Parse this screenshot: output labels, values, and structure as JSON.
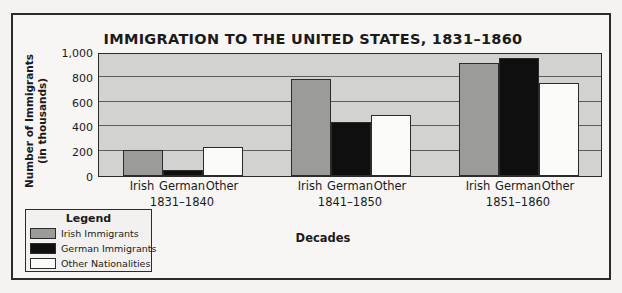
{
  "chart_data": {
    "type": "bar",
    "title": "IMMIGRATION TO THE UNITED STATES, 1831–1860",
    "xlabel": "Decades",
    "ylabel": "Number of Immigrants\n(in thousands)",
    "ylabel_line1": "Number of Immigrants",
    "ylabel_line2": "(in thousands)",
    "ylim": [
      0,
      1000
    ],
    "yticks": [
      0,
      200,
      400,
      600,
      800,
      1000
    ],
    "ytick_labels": [
      "0",
      "200",
      "400",
      "600",
      "800",
      "1,000"
    ],
    "grid": true,
    "legend_position": "below-left-outside",
    "categories": [
      "1831–1840",
      "1841–1850",
      "1851–1860"
    ],
    "subcategories": [
      "Irish",
      "German",
      "Other"
    ],
    "series": [
      {
        "name": "Irish Immigrants",
        "color": "#9b9b99",
        "values": [
          207,
          780,
          914
        ]
      },
      {
        "name": "German Immigrants",
        "color": "#100f0f",
        "values": [
          50,
          434,
          951
        ]
      },
      {
        "name": "Other Nationalities",
        "color": "#fbfbf9",
        "values": [
          234,
          495,
          750
        ]
      }
    ]
  },
  "legend": {
    "title": "Legend",
    "items": [
      {
        "label": "Irish Immigrants",
        "swatch": "irish"
      },
      {
        "label": "German Immigrants",
        "swatch": "german"
      },
      {
        "label": "Other Nationalities",
        "swatch": "other"
      }
    ]
  }
}
